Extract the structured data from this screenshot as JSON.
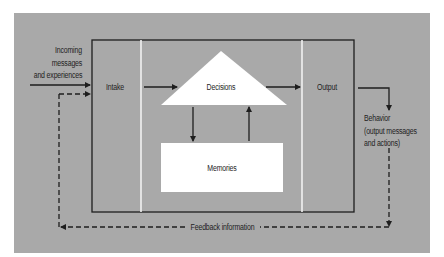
{
  "diagram": {
    "type": "flow",
    "colors": {
      "background": "#ffffff",
      "panel": "#a9a9a9",
      "shapes": "#ffffff",
      "lines": "#1e1e1e",
      "divider": "#f2f2f2"
    },
    "labels": {
      "incoming_line1": "Incoming",
      "incoming_line2": "messages",
      "incoming_line3": "and experiences",
      "intake": "Intake",
      "decisions": "Decisions",
      "memories": "Memories",
      "output": "Output",
      "behavior_line1": "Behavior",
      "behavior_line2": "(output messages",
      "behavior_line3": "and actions)",
      "feedback": "Feedback information"
    },
    "nodes": [
      {
        "id": "intake",
        "label": "Intake",
        "shape": "column"
      },
      {
        "id": "decisions",
        "label": "Decisions",
        "shape": "triangle"
      },
      {
        "id": "memories",
        "label": "Memories",
        "shape": "rectangle"
      },
      {
        "id": "output",
        "label": "Output",
        "shape": "column"
      }
    ],
    "edges": [
      {
        "from": "incoming",
        "to": "intake",
        "style": "solid"
      },
      {
        "from": "intake",
        "to": "decisions",
        "style": "solid"
      },
      {
        "from": "decisions",
        "to": "memories",
        "style": "solid"
      },
      {
        "from": "memories",
        "to": "decisions",
        "style": "solid"
      },
      {
        "from": "decisions",
        "to": "output",
        "style": "solid"
      },
      {
        "from": "output",
        "to": "behavior",
        "style": "solid"
      },
      {
        "from": "behavior",
        "to": "intake",
        "style": "dashed",
        "label": "Feedback information"
      }
    ]
  }
}
